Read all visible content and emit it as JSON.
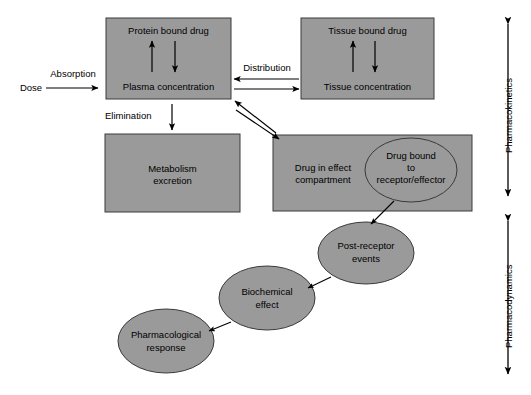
{
  "figure": {
    "fill_color": "#9a9a9a",
    "stroke_color": "#000000",
    "background": "#ffffff"
  },
  "nodes": {
    "dose": "Dose",
    "protein_bound_drug": "Protein bound drug",
    "plasma_concentration": "Plasma concentration",
    "tissue_bound_drug": "Tissue bound drug",
    "tissue_concentration": "Tissue concentration",
    "metabolism_line1": "Metabolism",
    "metabolism_line2": "excretion",
    "drug_in_effect_line1": "Drug in effect",
    "drug_in_effect_line2": "compartment",
    "drug_bound_line1": "Drug bound",
    "drug_bound_line2": "to",
    "drug_bound_line3": "receptor/effector",
    "post_receptor_line1": "Post-receptor",
    "post_receptor_line2": "events",
    "biochemical_line1": "Biochemical",
    "biochemical_line2": "effect",
    "pharmacological_line1": "Pharmacological",
    "pharmacological_line2": "response"
  },
  "edges": {
    "absorption": "Absorption",
    "distribution": "Distribution",
    "elimination": "Elimination"
  },
  "brackets": {
    "pharmacokinetics": "Pharmacokinetics",
    "pharmacodynamics": "Pharmacodynamics"
  }
}
